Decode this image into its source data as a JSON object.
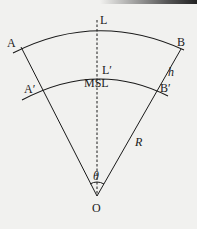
{
  "diagram": {
    "labels": {
      "L": "L",
      "A": "A",
      "B": "B",
      "L_prime": "L′",
      "MSL": "MSL",
      "A_prime": "A′",
      "B_prime": "B′",
      "h": "h",
      "R": "R",
      "theta": "θ",
      "O": "O"
    },
    "colors": {
      "line": "#1a1a1a",
      "background": "#f1f1ef"
    }
  }
}
